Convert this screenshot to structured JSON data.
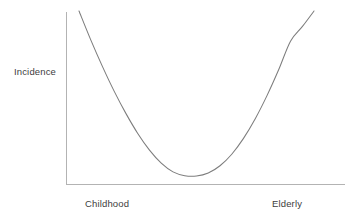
{
  "chart_data": {
    "type": "line",
    "title": "",
    "subtitle": "",
    "xlabel": "",
    "ylabel": "Incidence",
    "grid": false,
    "legend": false,
    "annotations": [],
    "axis_ranges": {
      "x": [
        0,
        1
      ],
      "y": [
        0,
        1
      ]
    },
    "tick_labels": {
      "x": [
        "Childhood",
        "Elderly"
      ],
      "y": []
    },
    "series": [
      {
        "name": "Incidence",
        "shape": "parabola",
        "x": [
          0.0,
          0.05,
          0.1,
          0.15,
          0.2,
          0.25,
          0.3,
          0.35,
          0.4,
          0.45,
          0.5,
          0.55,
          0.6,
          0.65,
          0.7,
          0.75,
          0.8,
          0.85,
          0.9,
          0.95,
          1.0
        ],
        "values": [
          1.0,
          0.825,
          0.663,
          0.513,
          0.378,
          0.258,
          0.157,
          0.078,
          0.025,
          0.002,
          0.0,
          0.018,
          0.062,
          0.132,
          0.228,
          0.347,
          0.487,
          0.645,
          0.817,
          0.905,
          1.0
        ]
      }
    ],
    "colors": {
      "curve": "#7d7d7d",
      "axis": "#b3b3b3",
      "text": "#3d3d3d",
      "background": "#ffffff"
    }
  },
  "labels": {
    "y_axis": "Incidence",
    "x_left": "Childhood",
    "x_right": "Elderly"
  }
}
